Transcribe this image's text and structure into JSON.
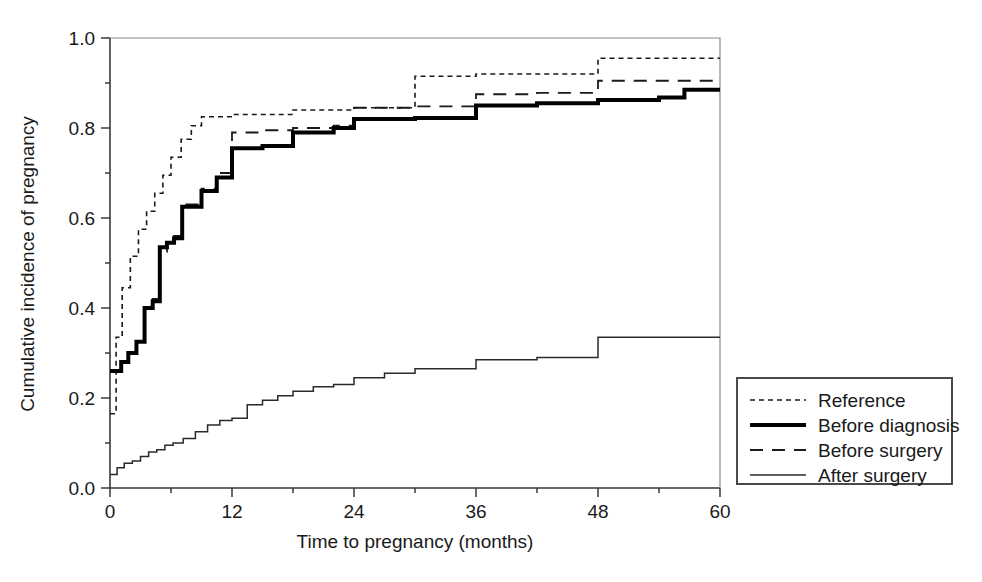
{
  "figure": {
    "background": "#ffffff",
    "frame_color": "#3a3a3a",
    "width": 982,
    "height": 582
  },
  "chart_data": {
    "type": "line",
    "title": "",
    "xlabel": "Time to pregnancy (months)",
    "ylabel": "Cumulative incidence of pregnancy",
    "xlim": [
      0,
      60
    ],
    "ylim": [
      0.0,
      1.0
    ],
    "xticks": [
      0,
      12,
      24,
      36,
      48,
      60
    ],
    "xtick_labels": [
      "0",
      "12",
      "24",
      "36",
      "48",
      "60"
    ],
    "yticks": [
      0.0,
      0.2,
      0.4,
      0.6,
      0.8,
      1.0
    ],
    "ytick_labels": [
      "0.0",
      "0.2",
      "0.4",
      "0.6",
      "0.8",
      "1.0"
    ],
    "grid": false,
    "legend_position": "right-outside",
    "step_style": "post",
    "series": [
      {
        "name": "Reference",
        "line_style": "dotted",
        "line_width": 1.6,
        "color": "#1a1a1a",
        "x": [
          0,
          0.6,
          1.2,
          2.0,
          2.8,
          3.6,
          4.4,
          5.2,
          6.0,
          7.0,
          8.0,
          9.0,
          12.0,
          18.0,
          24.0,
          30.0,
          36.0,
          48.0,
          60.0
        ],
        "y": [
          0.165,
          0.335,
          0.445,
          0.515,
          0.575,
          0.615,
          0.655,
          0.695,
          0.735,
          0.775,
          0.805,
          0.825,
          0.83,
          0.84,
          0.845,
          0.915,
          0.92,
          0.955,
          0.955
        ]
      },
      {
        "name": "Before diagnosis",
        "line_style": "solid-thick",
        "line_width": 4.0,
        "color": "#000000",
        "x": [
          0,
          1.1,
          1.8,
          2.6,
          3.4,
          4.2,
          4.9,
          5.6,
          6.3,
          7.1,
          9.0,
          10.5,
          12.0,
          15.0,
          18.0,
          22.0,
          24.0,
          30.0,
          36.0,
          42.0,
          48.0,
          54.0,
          56.5,
          60.0
        ],
        "y": [
          0.26,
          0.28,
          0.3,
          0.325,
          0.4,
          0.415,
          0.535,
          0.545,
          0.555,
          0.625,
          0.66,
          0.69,
          0.755,
          0.76,
          0.79,
          0.8,
          0.82,
          0.822,
          0.85,
          0.855,
          0.862,
          0.868,
          0.885,
          0.885
        ]
      },
      {
        "name": "Before surgery",
        "line_style": "dashed",
        "line_width": 1.8,
        "color": "#1a1a1a",
        "x": [
          0,
          1.1,
          1.8,
          2.6,
          3.4,
          4.2,
          4.9,
          5.6,
          6.3,
          7.1,
          9.0,
          10.5,
          12.0,
          15.0,
          18.0,
          22.0,
          24.0,
          30.0,
          36.0,
          42.0,
          48.0,
          54.0,
          60.0
        ],
        "y": [
          0.26,
          0.28,
          0.3,
          0.33,
          0.4,
          0.42,
          0.525,
          0.545,
          0.56,
          0.63,
          0.665,
          0.7,
          0.79,
          0.795,
          0.8,
          0.805,
          0.845,
          0.848,
          0.875,
          0.878,
          0.905,
          0.905,
          0.905
        ]
      },
      {
        "name": "After surgery",
        "line_style": "solid-thin",
        "line_width": 1.5,
        "color": "#2a2a2a",
        "x": [
          0,
          0.7,
          1.4,
          2.2,
          3.0,
          3.8,
          4.6,
          5.4,
          6.2,
          7.2,
          8.4,
          9.6,
          10.8,
          12.0,
          13.5,
          15.0,
          16.5,
          18.0,
          20.0,
          22.0,
          24.0,
          27.0,
          30.0,
          36.0,
          42.0,
          48.0,
          60.0
        ],
        "y": [
          0.03,
          0.045,
          0.055,
          0.06,
          0.07,
          0.08,
          0.085,
          0.095,
          0.1,
          0.11,
          0.125,
          0.14,
          0.15,
          0.155,
          0.185,
          0.195,
          0.205,
          0.215,
          0.225,
          0.23,
          0.245,
          0.255,
          0.265,
          0.285,
          0.29,
          0.335,
          0.335
        ]
      }
    ]
  },
  "legend": {
    "entries": [
      {
        "label": "Reference",
        "style": "dotted"
      },
      {
        "label": "Before diagnosis",
        "style": "solid-thick"
      },
      {
        "label": "Before surgery",
        "style": "dashed"
      },
      {
        "label": "After surgery",
        "style": "solid-thin"
      }
    ]
  }
}
